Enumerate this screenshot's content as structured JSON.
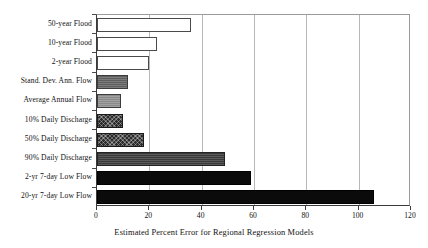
{
  "chart_data": {
    "type": "bar",
    "orientation": "horizontal",
    "title": "",
    "xlabel": "Estimated Percent Error for Regional Regression Models",
    "ylabel": "",
    "xlim": [
      0,
      120
    ],
    "xticks": [
      0,
      20,
      40,
      60,
      80,
      100,
      120
    ],
    "xticklabels": [
      "0",
      "20",
      "40",
      "60",
      "80",
      "100",
      "120"
    ],
    "grid": "vertical",
    "legend": "none",
    "categories": [
      "50-year Flood",
      "10-year Flood",
      "2-year Flood",
      "Stand. Dev. Ann. Flow",
      "Average Annual Flow",
      "10% Daily Discharge",
      "50% Daily Discharge",
      "90% Daily Discharge",
      "2-yr 7-day Low Flow",
      "20-yr 7-day Low Flow"
    ],
    "values": [
      36,
      23,
      20,
      12,
      9,
      10,
      18,
      49,
      59,
      106
    ],
    "bar_styles": [
      "open",
      "open",
      "open",
      "gray",
      "light-gray",
      "crosshatch",
      "crosshatch",
      "dark-gray",
      "solid-black",
      "solid-black"
    ],
    "colors": {
      "open": "#ffffff",
      "gray": "#5f5f5f",
      "light-gray": "#8a8a8a",
      "crosshatch": "#2b2b2b",
      "dark-gray": "#3a3a3a",
      "solid-black": "#0b0b0b",
      "axis": "#3a3a3a",
      "gridline": "#b8b8b8",
      "background": "#ffffff",
      "text": "#111111"
    }
  }
}
